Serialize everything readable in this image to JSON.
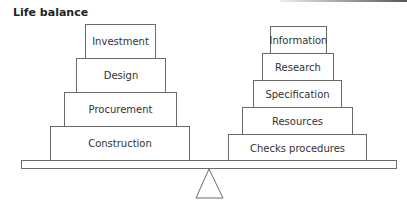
{
  "title": "Life balance",
  "left_stack": [
    {
      "label": "Investment",
      "x": 85,
      "y": 24,
      "w": 71,
      "h": 34
    },
    {
      "label": "Design",
      "x": 76,
      "y": 58,
      "w": 90,
      "h": 34
    },
    {
      "label": "Procurement",
      "x": 64,
      "y": 92,
      "w": 113,
      "h": 34
    },
    {
      "label": "Construction",
      "x": 50,
      "y": 126,
      "w": 140,
      "h": 34
    }
  ],
  "right_stack": [
    {
      "label": "Information",
      "x": 270,
      "y": 26,
      "w": 57,
      "h": 27
    },
    {
      "label": "Research",
      "x": 262,
      "y": 53,
      "w": 72,
      "h": 27
    },
    {
      "label": "Specification",
      "x": 253,
      "y": 80,
      "w": 89,
      "h": 27
    },
    {
      "label": "Resources",
      "x": 242,
      "y": 107,
      "w": 111,
      "h": 27
    },
    {
      "label": "Checks procedures",
      "x": 228,
      "y": 134,
      "w": 139,
      "h": 27
    }
  ],
  "colors": {
    "line": "#6a6a6a",
    "text": "#333333"
  }
}
